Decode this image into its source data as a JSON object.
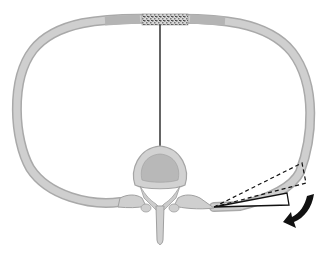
{
  "diagram": {
    "parts": [
      {
        "id": "rib-ring",
        "label": "rib"
      },
      {
        "id": "costal-cartilage",
        "label": "costal cartilage"
      },
      {
        "id": "sternum",
        "label": "sternum"
      },
      {
        "id": "vertebra",
        "label": "thoracic vertebra"
      },
      {
        "id": "axis-line",
        "label": "sagittal axis"
      },
      {
        "id": "rib-motion-angle",
        "label": "rib elevation angle (dashed = elevated, solid = depressed)"
      },
      {
        "id": "motion-arrow",
        "label": "direction of rib rotation (downward)"
      }
    ],
    "colors": {
      "bone": "#c8c8c8",
      "bone_edge": "#a8a8a8",
      "cartilage": "#b8b8b8",
      "sternum": "#909090",
      "line": "#111111",
      "arrow": "#111111"
    }
  }
}
